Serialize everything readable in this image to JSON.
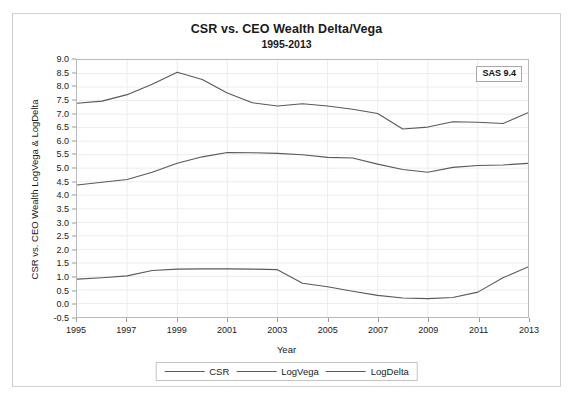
{
  "figure": {
    "title": "CSR vs. CEO Wealth Delta/Vega",
    "subtitle": "1995-2013",
    "badge": "SAS 9.4"
  },
  "chart_data": {
    "type": "line",
    "title": "CSR vs. CEO Wealth Delta/Vega",
    "subtitle": "1995-2013",
    "xlabel": "Year",
    "ylabel": "CSR vs. CEO Wealth LogVega & LogDelta",
    "xlim": [
      1995,
      2013
    ],
    "ylim": [
      -0.5,
      9.0
    ],
    "xticks": [
      1995,
      1997,
      1999,
      2001,
      2003,
      2005,
      2007,
      2009,
      2011,
      2013
    ],
    "xtick_labels": [
      "1995",
      "1997",
      "1999",
      "2001",
      "2003",
      "2005",
      "2007",
      "2009",
      "2011",
      "2013"
    ],
    "yticks": [
      -0.5,
      0.0,
      0.5,
      1.0,
      1.5,
      2.0,
      2.5,
      3.0,
      3.5,
      4.0,
      4.5,
      5.0,
      5.5,
      6.0,
      6.5,
      7.0,
      7.5,
      8.0,
      8.5,
      9.0
    ],
    "ytick_labels": [
      "-0.5",
      "0.0",
      "0.5",
      "1.0",
      "1.5",
      "2.0",
      "2.5",
      "3.0",
      "3.5",
      "4.0",
      "4.5",
      "5.0",
      "5.5",
      "6.0",
      "6.5",
      "7.0",
      "7.5",
      "8.0",
      "8.5",
      "9.0"
    ],
    "grid": true,
    "legend_position": "bottom",
    "line_color": "#595959",
    "x": [
      1995,
      1996,
      1997,
      1998,
      1999,
      2000,
      2001,
      2002,
      2003,
      2004,
      2005,
      2006,
      2007,
      2008,
      2009,
      2010,
      2011,
      2012,
      2013
    ],
    "series": [
      {
        "name": "CSR",
        "values": [
          0.9,
          0.95,
          1.02,
          1.22,
          1.27,
          1.28,
          1.28,
          1.27,
          1.25,
          0.75,
          0.62,
          0.45,
          0.3,
          0.2,
          0.18,
          0.22,
          0.42,
          0.95,
          1.35
        ]
      },
      {
        "name": "LogVega",
        "values": [
          4.38,
          4.48,
          4.58,
          4.85,
          5.18,
          5.42,
          5.58,
          5.57,
          5.55,
          5.5,
          5.4,
          5.38,
          5.15,
          4.95,
          4.85,
          5.03,
          5.1,
          5.12,
          5.18
        ]
      },
      {
        "name": "LogDelta",
        "values": [
          7.4,
          7.48,
          7.72,
          8.1,
          8.55,
          8.28,
          7.78,
          7.42,
          7.3,
          7.38,
          7.3,
          7.18,
          7.02,
          6.45,
          6.52,
          6.72,
          6.7,
          6.65,
          7.05
        ]
      }
    ]
  },
  "legend": {
    "entries": [
      {
        "label": "CSR"
      },
      {
        "label": "LogVega"
      },
      {
        "label": "LogDelta"
      }
    ]
  }
}
